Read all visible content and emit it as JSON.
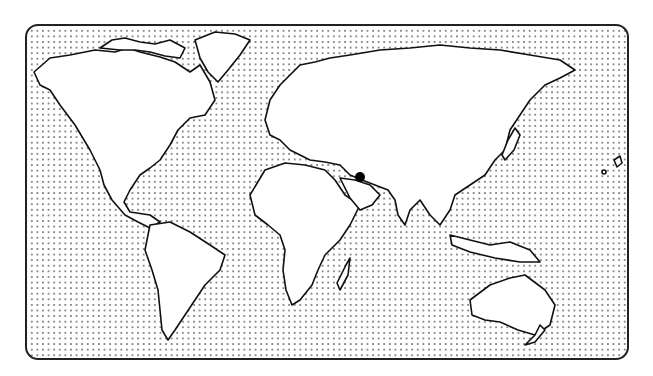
{
  "map": {
    "type": "world-outline",
    "style": "dotted-ocean",
    "ocean_pattern_color": "#8a8a8a",
    "land_fill": "#ffffff",
    "outline_color": "#111111",
    "marker": {
      "icon": "location-dot-icon",
      "color": "#000000",
      "approx_location": "Persian Gulf / Iran region",
      "x": 360,
      "y": 177
    },
    "regions": [
      "North America",
      "South America",
      "Greenland",
      "Europe",
      "Africa",
      "Asia",
      "Australia",
      "New Zealand",
      "Madagascar",
      "Japan",
      "Indonesia"
    ]
  }
}
